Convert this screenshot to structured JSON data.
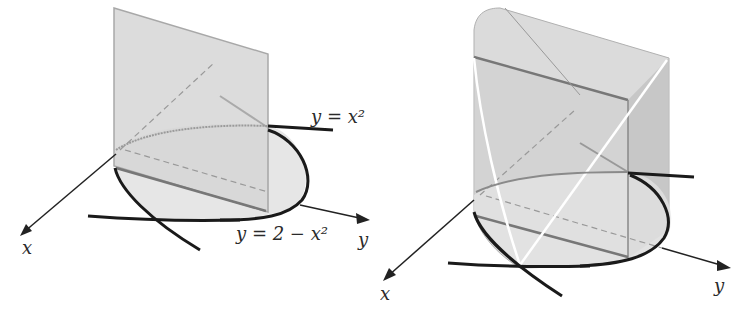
{
  "figures": {
    "left": {
      "title": "Region between parabolas with vertical plane",
      "curve_upper_label": "y = x²",
      "curve_lower_label": "y = 2 − x²",
      "axis_x_label": "x",
      "axis_y_label": "y"
    },
    "right": {
      "title": "Solid with parabolic base and slanted top",
      "axis_x_label": "x",
      "axis_y_label": "y"
    }
  },
  "colors": {
    "surface_light": "#e4e4e4",
    "surface_mid": "#d2d2d2",
    "surface_dark": "#bdbdbd",
    "edge": "#9a9a9a",
    "curve": "#1a1a1a",
    "axis": "#222222",
    "highlight": "#ffffff"
  }
}
